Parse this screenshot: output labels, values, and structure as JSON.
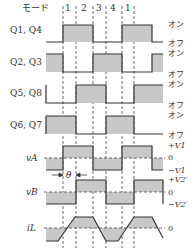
{
  "diagram": {
    "mode_label": "モード",
    "modes": [
      "1",
      "2",
      "3",
      "4",
      "1"
    ],
    "signals": [
      {
        "name": "Q1, Q4",
        "high": "オン",
        "low": "オフ"
      },
      {
        "name": "Q2, Q3",
        "high": "オン",
        "low": "オフ"
      },
      {
        "name": "Q5, Q8",
        "high": "オン",
        "low": "オフ"
      },
      {
        "name": "Q6, Q7",
        "high": "オン",
        "low": "オフ"
      }
    ],
    "vA": {
      "name": "vA",
      "pos": "+V1",
      "zero": "0",
      "neg": "−V1"
    },
    "vB": {
      "name": "vB",
      "pos": "+V2′",
      "zero": "0",
      "neg": "−V2′"
    },
    "iL": {
      "name": "iL",
      "zero": "0"
    },
    "phase_label": "θ",
    "colors": {
      "fill": "#c8c8c8",
      "line": "#333333"
    }
  }
}
